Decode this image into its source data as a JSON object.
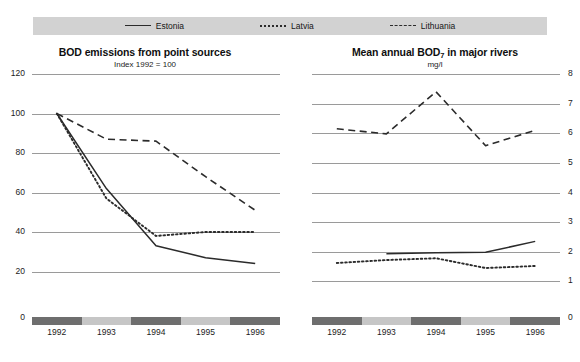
{
  "legend": {
    "items": [
      {
        "label": "Estonia",
        "style": "solid",
        "icon": "line-solid-icon"
      },
      {
        "label": "Latvia",
        "style": "dotted",
        "icon": "line-dotted-icon"
      },
      {
        "label": "Lithuania",
        "style": "dashed",
        "icon": "line-dashed-icon"
      }
    ]
  },
  "colors": {
    "line": "#2b2b2b",
    "grid": "#9a9a9a",
    "legend_bar": "#d2d2d2",
    "band_dark": "#6e6e6e",
    "band_light": "#c6c6c6"
  },
  "chart_data": [
    {
      "id": "bod-emissions",
      "type": "line",
      "title": "BOD emissions from point sources",
      "subtitle": "Index 1992 = 100",
      "xlabel": "",
      "ylabel": "",
      "x": [
        "1992",
        "1993",
        "1994",
        "1995",
        "1996"
      ],
      "categories": [
        "1992",
        "1993",
        "1994",
        "1995",
        "1996"
      ],
      "ylim": [
        0,
        120
      ],
      "yticks": [
        0,
        20,
        40,
        60,
        80,
        100,
        120
      ],
      "grid": true,
      "legend_position": "top",
      "series": [
        {
          "name": "Estonia",
          "style": "solid",
          "values": [
            100,
            62,
            33,
            27,
            24
          ]
        },
        {
          "name": "Latvia",
          "style": "dotted",
          "values": [
            100,
            57,
            38,
            40,
            40
          ]
        },
        {
          "name": "Lithuania",
          "style": "dashed",
          "values": [
            100,
            87,
            86,
            68,
            51
          ]
        }
      ]
    },
    {
      "id": "bod7-rivers",
      "type": "line",
      "title": "Mean annual BOD7 in major rivers",
      "title_main": "Mean annual BOD",
      "title_sub": "7",
      "title_tail": " in major rivers",
      "subtitle": "mg/l",
      "xlabel": "",
      "ylabel": "mg/l",
      "x": [
        "1992",
        "1993",
        "1994",
        "1995",
        "1996"
      ],
      "categories": [
        "1992",
        "1993",
        "1994",
        "1995",
        "1996"
      ],
      "ylim": [
        0,
        8
      ],
      "yticks": [
        0,
        1,
        2,
        3,
        4,
        5,
        6,
        7,
        8
      ],
      "grid": true,
      "legend_position": "top",
      "series": [
        {
          "name": "Estonia",
          "style": "solid",
          "values": [
            null,
            1.93,
            1.97,
            1.98,
            2.35
          ]
        },
        {
          "name": "Latvia",
          "style": "dotted",
          "values": [
            1.62,
            1.72,
            1.78,
            1.45,
            1.52
          ]
        },
        {
          "name": "Lithuania",
          "style": "dashed",
          "values": [
            6.15,
            5.98,
            7.4,
            5.58,
            6.1
          ]
        }
      ]
    }
  ]
}
